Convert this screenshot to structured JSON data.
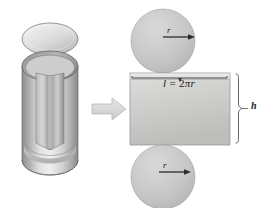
{
  "figure": {
    "background_color": "#ffffff"
  },
  "labels": {
    "circumference_prefix": "l",
    "circumference_equals": " = ",
    "circumference_coefficient": "2",
    "circumference_pi": "π",
    "circumference_radius": "r",
    "radius_top": "r",
    "radius_bottom": "r",
    "height": "h"
  },
  "solid": {
    "name": "cut-open-cylinder",
    "lid_name": "cylinder-lid-ellipse",
    "body_name": "cylinder-body",
    "slit_name": "cylinder-vertical-slit"
  },
  "transform_arrow": {
    "name": "transform-arrow",
    "direction": "right"
  },
  "net": {
    "top_disc_name": "top-circle-face",
    "bottom_disc_name": "bottom-circle-face",
    "rectangle_name": "lateral-surface-rectangle",
    "circumference_arc_name": "circumference-measure-arc",
    "height_brace_name": "height-brace"
  },
  "colors": {
    "outline": "#5a5a5a",
    "fill_light": "#f0f0f0",
    "fill_mid": "#c8c8c8",
    "fill_dark": "#9a9a9a",
    "label_text": "#1a1a1a",
    "arrow_fill": "#d8d8d8"
  }
}
